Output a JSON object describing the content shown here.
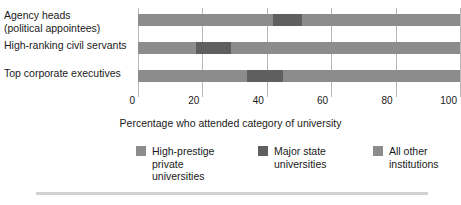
{
  "chart_data": {
    "type": "bar",
    "orientation": "horizontal",
    "stacked": true,
    "title": "",
    "xlabel": "Percentage who attended category of university",
    "ylabel": "",
    "xlim": [
      0,
      100
    ],
    "xticks": [
      0,
      20,
      40,
      60,
      80,
      100
    ],
    "xtick_labels": [
      "0",
      "20",
      "40",
      "60",
      "80",
      "100"
    ],
    "grid": true,
    "legend_position": "bottom",
    "categories": [
      "Agency heads (political appointees)",
      "High-ranking civil servants",
      "Top corporate executives"
    ],
    "category_lines": [
      [
        "Agency heads",
        "(political appointees)"
      ],
      [
        "High-ranking civil servants"
      ],
      [
        "Top corporate executives"
      ]
    ],
    "series": [
      {
        "name": "High-prestige private universities",
        "name_lines": [
          "High-prestige",
          "private",
          "universities"
        ],
        "color": "#8c8c8c",
        "values": [
          42,
          18,
          34
        ]
      },
      {
        "name": "Major state universities",
        "name_lines": [
          "Major state",
          "universities"
        ],
        "color": "#5f5f5f",
        "values": [
          9,
          11,
          11
        ]
      },
      {
        "name": "All other institutions",
        "name_lines": [
          "All other",
          "institutions"
        ],
        "color": "#8c8c8c",
        "values": [
          49,
          71,
          55
        ]
      }
    ],
    "segment_boundaries": [
      [
        0,
        42,
        51,
        100
      ],
      [
        0,
        18,
        29,
        100
      ],
      [
        0,
        34,
        45,
        100
      ]
    ]
  },
  "colors": {
    "grid": "#b9b9b9",
    "text": "#1a1a1a",
    "rule": "#d2d2d2",
    "background": "#ffffff"
  }
}
